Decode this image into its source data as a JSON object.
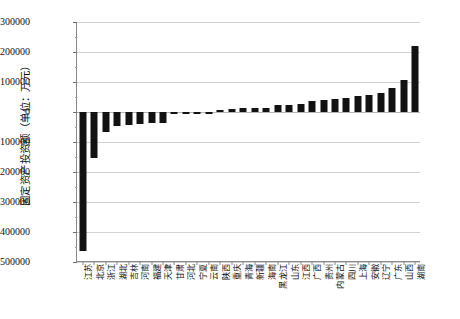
{
  "chart_data": {
    "type": "bar",
    "title": "",
    "subtitle": "",
    "xlabel": "",
    "ylabel": "固定资产投资额（单位：万元）",
    "ylim": [
      -500000,
      300000
    ],
    "ytick_values": [
      300000,
      200000,
      100000,
      0,
      -100000,
      -200000,
      -300000,
      -400000,
      -500000
    ],
    "ytick_labels": [
      "300000",
      "200000",
      "100000",
      "0",
      "-100000",
      "-200000",
      "-300000",
      "-400000",
      "-500000"
    ],
    "grid": true,
    "grid_axis": "y",
    "legend": false,
    "legend_position": "none",
    "bar_color": "#121212",
    "orientation": "vertical",
    "categories": [
      "江苏",
      "北京",
      "浙江",
      "湖北",
      "吉林",
      "河南",
      "福建",
      "天津",
      "甘肃",
      "河北",
      "宁夏",
      "云南",
      "陕西",
      "重庆",
      "青海",
      "新疆",
      "海南",
      "黑龙江",
      "山东",
      "江西",
      "广西",
      "贵州",
      "内蒙古",
      "四川",
      "上海",
      "安徽",
      "辽宁",
      "广东",
      "山西",
      "湖南"
    ],
    "values": [
      -462000,
      -152000,
      -68000,
      -48000,
      -44000,
      -40000,
      -38000,
      -36000,
      -8000,
      -3000,
      -1500,
      -1000,
      6000,
      10000,
      13000,
      14000,
      15000,
      22000,
      24000,
      26000,
      38000,
      40000,
      44000,
      48000,
      52000,
      56000,
      62000,
      80000,
      108000,
      220000
    ]
  }
}
